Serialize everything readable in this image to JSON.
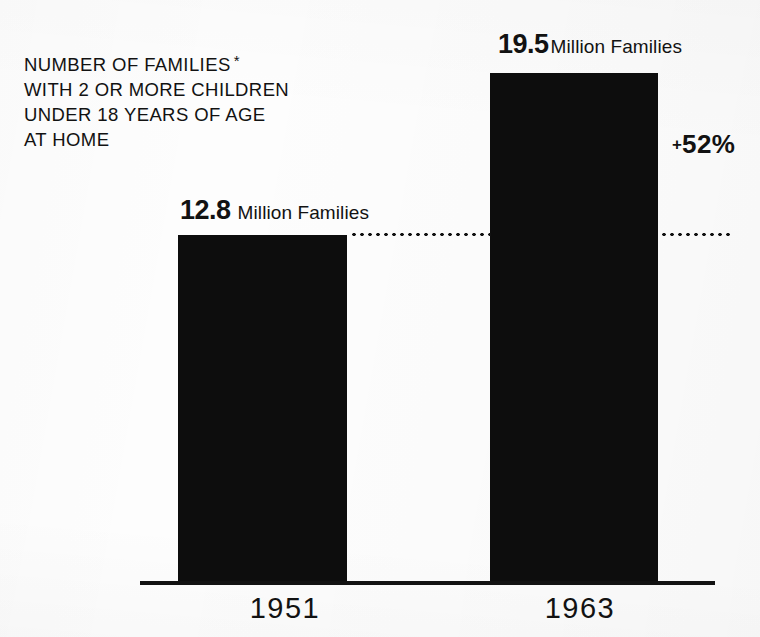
{
  "chart_data": {
    "type": "bar",
    "title_lines": [
      "NUMBER OF FAMILIES",
      "WITH 2 OR MORE CHILDREN",
      "UNDER 18 YEARS OF AGE",
      "AT HOME"
    ],
    "title_footnote_marker": "*",
    "categories": [
      "1951",
      "1963"
    ],
    "values": [
      12.8,
      19.5
    ],
    "value_labels": [
      "12.8",
      "19.5"
    ],
    "value_unit": "Million Families",
    "unit": "Million Families",
    "xlabel": "",
    "ylabel": "",
    "ylim": [
      0,
      19.5
    ],
    "grid": false,
    "legend": "none",
    "bar_color": "#0d0d0d",
    "background_color": "#fdfdfd",
    "annotations": [
      {
        "name": "percent-change",
        "sign": "+",
        "amount": "52%",
        "text": "+52%",
        "describes": "percent increase from 1951 to 1963"
      },
      {
        "name": "reference-leader-line",
        "style": "dotted",
        "at_value": 12.8,
        "text": ""
      }
    ]
  },
  "axis": {
    "ticks": [
      {
        "label": "1951"
      },
      {
        "label": "1963"
      }
    ]
  },
  "bars": [
    {
      "year": "1951",
      "number": "12.8",
      "unit": "Million Families"
    },
    {
      "year": "1963",
      "number": "19.5",
      "unit": "Million Families"
    }
  ]
}
